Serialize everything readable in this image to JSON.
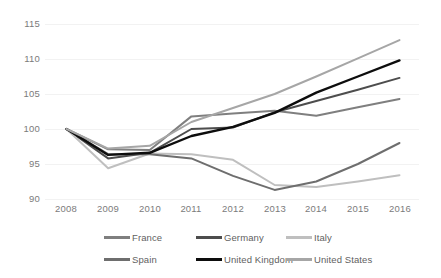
{
  "chart_data": {
    "type": "line",
    "title": "",
    "subtitle": "",
    "xlabel": "",
    "ylabel": "",
    "x": [
      2008,
      2009,
      2010,
      2011,
      2012,
      2013,
      2014,
      2015,
      2016
    ],
    "categories": [
      "2008",
      "2009",
      "2010",
      "2011",
      "2012",
      "2013",
      "2014",
      "2015",
      "2016"
    ],
    "ylim": [
      90,
      115
    ],
    "yticks": [
      90,
      95,
      100,
      105,
      110,
      115
    ],
    "ytick_labels": [
      "90",
      "95",
      "100",
      "105",
      "110",
      "115"
    ],
    "grid": true,
    "legend_position": "bottom",
    "series": [
      {
        "name": "France",
        "color": "#7f7f7f",
        "values": [
          100.0,
          97.1,
          97.0,
          101.8,
          102.2,
          102.6,
          101.9,
          103.1,
          104.3
        ]
      },
      {
        "name": "Germany",
        "color": "#4d4d4d",
        "values": [
          100.0,
          95.8,
          96.6,
          100.0,
          100.2,
          102.4,
          104.0,
          105.6,
          107.3
        ]
      },
      {
        "name": "Italy",
        "color": "#bfbfbf",
        "values": [
          100.0,
          94.4,
          96.5,
          96.4,
          95.6,
          92.0,
          91.7,
          92.5,
          93.4
        ]
      },
      {
        "name": "Spain",
        "color": "#6e6e6e",
        "values": [
          100.0,
          96.4,
          96.4,
          95.8,
          93.3,
          91.3,
          92.5,
          95.0,
          98.0
        ]
      },
      {
        "name": "United Kingdom",
        "color": "#0d0d0d",
        "values": [
          100.0,
          96.3,
          96.6,
          99.0,
          100.3,
          102.3,
          105.2,
          107.5,
          109.8
        ]
      },
      {
        "name": "United States",
        "color": "#a6a6a6",
        "values": [
          100.0,
          97.2,
          97.6,
          101.0,
          103.0,
          105.0,
          107.5,
          110.1,
          112.7
        ]
      }
    ]
  },
  "legend": {
    "rows": [
      [
        {
          "label": "France",
          "color": "#7f7f7f",
          "x": 104
        },
        {
          "label": "Germany",
          "color": "#4d4d4d",
          "x": 196
        },
        {
          "label": "Italy",
          "color": "#bfbfbf",
          "x": 286
        }
      ],
      [
        {
          "label": "Spain",
          "color": "#6e6e6e",
          "x": 104
        },
        {
          "label": "United Kingdom",
          "color": "#0d0d0d",
          "x": 196
        },
        {
          "label": "United States",
          "color": "#a6a6a6",
          "x": 286
        }
      ]
    ]
  }
}
